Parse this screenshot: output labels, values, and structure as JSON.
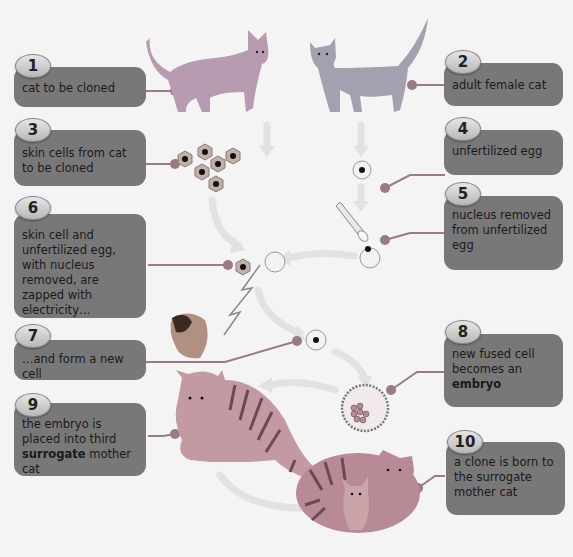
{
  "steps": [
    {
      "number": "1",
      "text": "cat to be cloned"
    },
    {
      "number": "2",
      "text": "adult female cat"
    },
    {
      "number": "3",
      "text": "skin cells from cat to be cloned"
    },
    {
      "number": "4",
      "text": "unfertilized egg"
    },
    {
      "number": "5",
      "text": "nucleus removed from unfertilized egg"
    },
    {
      "number": "6",
      "text": "skin cell and unfertilized egg, with nucleus removed, are zapped with electricity…"
    },
    {
      "number": "7",
      "text": "…and form a new cell"
    },
    {
      "number": "8",
      "text_before": "new fused cell becomes an ",
      "text_bold": "embryo",
      "text_after": ""
    },
    {
      "number": "9",
      "text_before": "the embryo is placed into third ",
      "text_bold": "surrogate",
      "text_after": " mother cat"
    },
    {
      "number": "10",
      "text": "a clone is born to the surrogate mother cat"
    }
  ],
  "illustrations": {
    "cat_to_clone": "cat-to-be-cloned",
    "female_cat": "adult-female-cat",
    "skin_cells": "skin-cells-cluster",
    "egg": "unfertilized-egg",
    "pipette": "pipette-removing-nucleus",
    "electricity": "lightning-bolt",
    "fused_cell": "new-fused-cell",
    "embryo": "embryo",
    "surrogate_cat": "surrogate-mother-cat",
    "cloned_kitten": "cloned-kitten-with-mother"
  },
  "colors": {
    "box": "#787878",
    "badge": "#cfcfcf",
    "connector": "#9a7a86",
    "arrow": "#e0e0e0",
    "background": "#f4f4f4"
  }
}
